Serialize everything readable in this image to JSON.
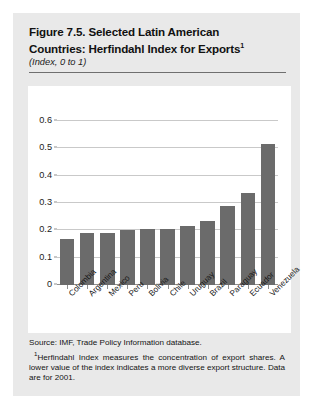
{
  "figure": {
    "title_main": "Figure 7.5. Selected Latin American Countries: Herfindahl Index for Exports",
    "title_line1": "Figure 7.5. Selected Latin American",
    "title_line2": "Countries: Herfindahl Index for Exports",
    "title_footnote_marker": "1",
    "subtitle": "(Index, 0 to 1)",
    "source_note": "Source: IMF, Trade Policy Information database.",
    "footnote_marker": "1",
    "footnote_text": "Herfindahl Index measures the concentration of export shares. A lower value of the index indicates a more diverse export structure. Data are for 2001."
  },
  "colors": {
    "card_background": "#e9e9e9",
    "plot_background": "#ffffff",
    "bar_fill": "#6b6b6b",
    "gridline": "#c9c9c9",
    "axis": "#8f8f8f",
    "text": "#131313"
  },
  "chart_data": {
    "type": "bar",
    "title": "Figure 7.5. Selected Latin American Countries: Herfindahl Index for Exports",
    "subtitle": "(Index, 0 to 1)",
    "xlabel": "",
    "ylabel": "",
    "ylim": [
      0,
      0.6
    ],
    "yticks": [
      0,
      0.1,
      0.2,
      0.3,
      0.4,
      0.5,
      0.6
    ],
    "ytick_labels": [
      "0",
      "0.1",
      "0.2",
      "0.3",
      "0.4",
      "0.5",
      "0.6"
    ],
    "grid": true,
    "legend": false,
    "categories": [
      "Colombia",
      "Argentina",
      "Mexico",
      "Peru",
      "Bolivia",
      "Chile",
      "Uruguay",
      "Brazil",
      "Paraguay",
      "Ecuador",
      "Venezuela"
    ],
    "values": [
      0.17,
      0.19,
      0.19,
      0.2,
      0.205,
      0.205,
      0.215,
      0.235,
      0.29,
      0.335,
      0.515
    ]
  }
}
